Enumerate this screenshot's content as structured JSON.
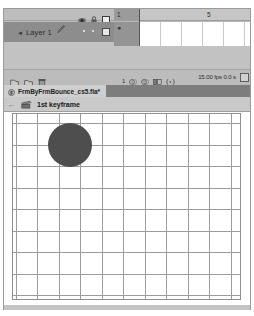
{
  "window": {
    "title": "Adobe Flash Timeline and Stage"
  },
  "timeline": {
    "layer_header": {
      "eye_icon": "eye-icon",
      "lock_icon": "lock-icon",
      "outline_icon": "outline-square-icon"
    },
    "layers": [
      {
        "name": "Layer 1",
        "selected": true,
        "pencil_icon": "pencil-icon",
        "expand_icon": "layer-expand-arrow-icon",
        "visible_dot": "•",
        "lock_dot": "•",
        "outline_box": "outline-square-icon"
      }
    ],
    "ruler": {
      "ticks": [
        {
          "label": "1",
          "x": 2
        },
        {
          "label": "5",
          "x": 93
        }
      ],
      "selected_frame": 1
    },
    "frames": {
      "cell_width": 21,
      "count": 6,
      "keyframe_marker": "●",
      "playhead_frame": 1
    },
    "toolbar": {
      "left_icons": [
        "new-layer-icon",
        "new-folder-icon",
        "delete-layer-icon"
      ],
      "current_frame": "1",
      "center_icons": [
        "onion-skin-icon",
        "onion-skin-outline-icon",
        "edit-multiple-frames-icon",
        "modify-onion-markers-icon"
      ],
      "status": "15.00 fps   0.0 s",
      "fps": "15.00 fps",
      "elapsed": "0.0 s",
      "end_button": "timeline-options-icon"
    }
  },
  "document_tab": {
    "icon": "flash-document-icon",
    "label": "FrmByFrmBounce_cs5.fla*",
    "modified": true
  },
  "breadcrumb": {
    "back_icon": "back-arrow-icon",
    "scene_icon": "scene-icon",
    "label": "1st keyframe"
  },
  "stage": {
    "background_color": "#ffffff",
    "grid": {
      "color": "#9b9b9b",
      "cell_size": 21,
      "vertical_lines": [
        3,
        24,
        46,
        67,
        89,
        110,
        132,
        153,
        175,
        196,
        218
      ],
      "horizontal_lines": [
        9,
        31,
        52,
        74,
        95,
        117,
        138,
        160,
        181
      ]
    },
    "objects": [
      {
        "name": "bouncing-ball",
        "shape": "circle",
        "color": "#4e4e4e",
        "center_x": 57,
        "center_y": 31,
        "radius": 22
      }
    ]
  }
}
